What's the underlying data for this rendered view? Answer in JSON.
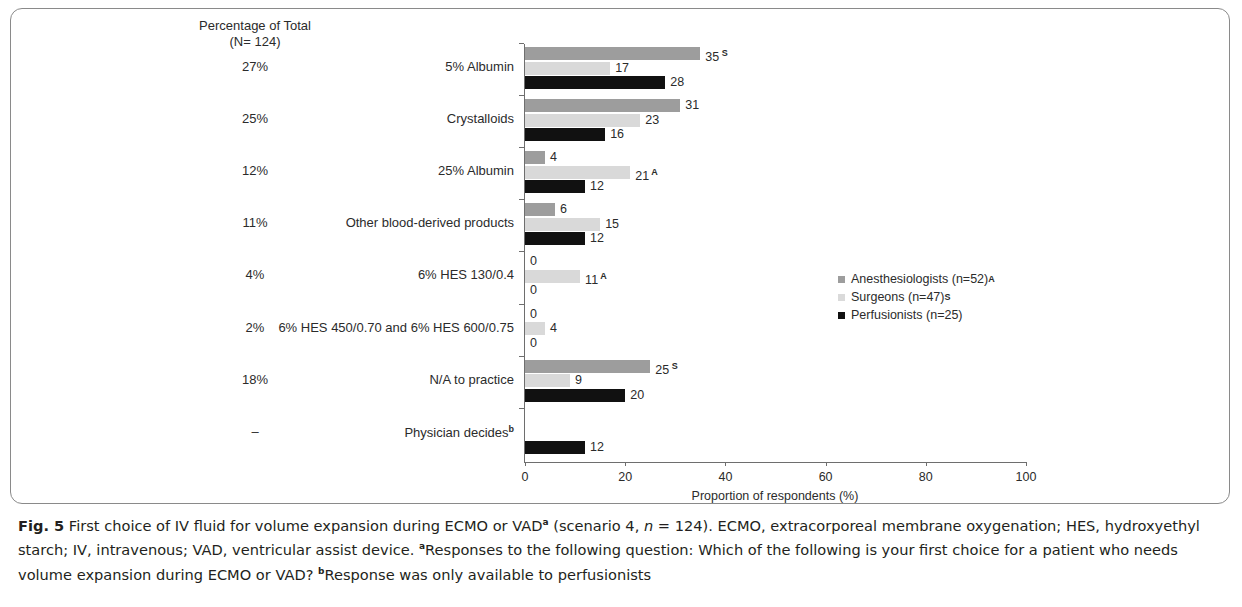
{
  "figure": {
    "percent_header_line1": "Percentage of Total",
    "percent_header_line2": "(N= 124)",
    "caption_label": "Fig. 5",
    "caption_text_1": " First choice of IV fluid for volume expansion during ECMO or VAD",
    "caption_sup_a": "a",
    "caption_text_2": " (scenario 4, ",
    "caption_italic_n": "n",
    "caption_text_3": " = 124). ECMO, extracorporeal membrane oxygenation; HES, hydroxyethyl starch; IV, intravenous; VAD, ventricular assist device. ",
    "caption_sup_a2": "a",
    "caption_text_4": "Responses to the following question: Which of the following is your first choice for a patient who needs volume expansion during ECMO or VAD? ",
    "caption_sup_b": "b",
    "caption_text_5": "Response was only available to perfusionists"
  },
  "chart_data": {
    "type": "bar",
    "orientation": "horizontal",
    "title": "",
    "xlabel": "Proportion of respondents (%)",
    "ylabel": "",
    "xlim": [
      0,
      100
    ],
    "xticks": [
      0,
      20,
      40,
      60,
      80,
      100
    ],
    "grid": false,
    "legend_position": "middle-right",
    "categories": [
      "5% Albumin",
      "Crystalloids",
      "25% Albumin",
      "Other blood-derived products",
      "6% HES 130/0.4",
      "6% HES 450/0.70 and 6% HES 600/0.75",
      "N/A to practice",
      "Physician decides"
    ],
    "category_superscripts": [
      "",
      "",
      "",
      "",
      "",
      "",
      "",
      "b"
    ],
    "percentage_of_total": [
      "27%",
      "25%",
      "12%",
      "11%",
      "4%",
      "2%",
      "18%",
      "–"
    ],
    "series": [
      {
        "name": "Anesthesiologists (n=52)",
        "marker": "A",
        "color": "#9d9d9d",
        "values": [
          35,
          31,
          4,
          6,
          0,
          0,
          25,
          null
        ],
        "value_labels": [
          "35",
          "31",
          "4",
          "6",
          "0",
          "0",
          "25",
          ""
        ],
        "significance": [
          "S",
          "",
          "",
          "",
          "",
          "",
          "S",
          ""
        ]
      },
      {
        "name": "Surgeons (n=47)",
        "marker": "S",
        "color": "#d9d9d9",
        "values": [
          17,
          23,
          21,
          15,
          11,
          4,
          9,
          null
        ],
        "value_labels": [
          "17",
          "23",
          "21",
          "15",
          "11",
          "4",
          "9",
          ""
        ],
        "significance": [
          "",
          "",
          "A",
          "",
          "A",
          "",
          "",
          ""
        ]
      },
      {
        "name": "Perfusionists (n=25)",
        "marker": "",
        "color": "#111111",
        "values": [
          28,
          16,
          12,
          12,
          0,
          0,
          20,
          12
        ],
        "value_labels": [
          "28",
          "16",
          "12",
          "12",
          "0",
          "0",
          "20",
          "12"
        ],
        "significance": [
          "",
          "",
          "",
          "",
          "",
          "",
          "",
          ""
        ]
      }
    ]
  }
}
